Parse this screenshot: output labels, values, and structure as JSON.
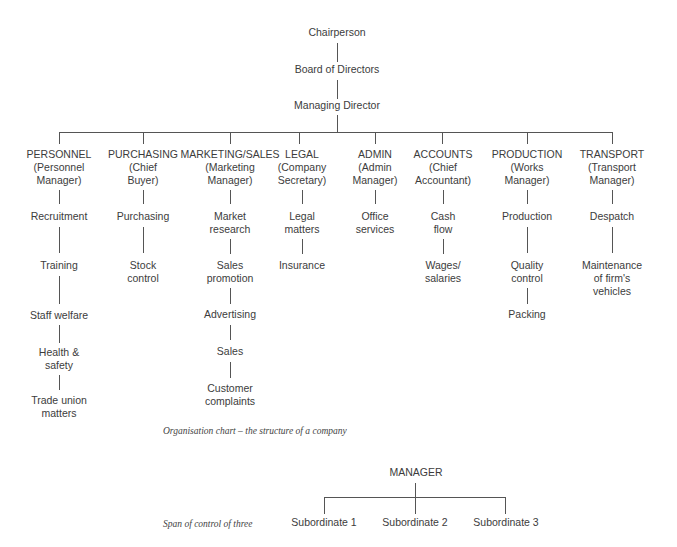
{
  "org_chart": {
    "top": [
      {
        "label": "Chairperson"
      },
      {
        "label": "Board of Directors"
      },
      {
        "label": "Managing Director"
      }
    ],
    "departments": [
      {
        "title": [
          "PERSONNEL",
          "(Personnel",
          "Manager)"
        ],
        "functions": [
          [
            "Recruitment"
          ],
          [
            "Training"
          ],
          [
            "Staff welfare"
          ],
          [
            "Health &",
            "safety"
          ],
          [
            "Trade union",
            "matters"
          ]
        ]
      },
      {
        "title": [
          "PURCHASING",
          "(Chief",
          "Buyer)"
        ],
        "functions": [
          [
            "Purchasing"
          ],
          [
            "Stock",
            "control"
          ]
        ]
      },
      {
        "title": [
          "MARKETING/SALES",
          "(Marketing",
          "Manager)"
        ],
        "functions": [
          [
            "Market",
            "research"
          ],
          [
            "Sales",
            "promotion"
          ],
          [
            "Advertising"
          ],
          [
            "Sales"
          ],
          [
            "Customer",
            "complaints"
          ]
        ]
      },
      {
        "title": [
          "LEGAL",
          "(Company",
          "Secretary)"
        ],
        "functions": [
          [
            "Legal",
            "matters"
          ],
          [
            "Insurance"
          ]
        ]
      },
      {
        "title": [
          "ADMIN",
          "(Admin",
          "Manager)"
        ],
        "functions": [
          [
            "Office",
            "services"
          ]
        ]
      },
      {
        "title": [
          "ACCOUNTS",
          "(Chief",
          "Accountant)"
        ],
        "functions": [
          [
            "Cash",
            "flow"
          ],
          [
            "Wages/",
            "salaries"
          ]
        ]
      },
      {
        "title": [
          "PRODUCTION",
          "(Works",
          "Manager)"
        ],
        "functions": [
          [
            "Production"
          ],
          [
            "Quality",
            "control"
          ],
          [
            "Packing"
          ]
        ]
      },
      {
        "title": [
          "TRANSPORT",
          "(Transport",
          "Manager)"
        ],
        "functions": [
          [
            "Despatch"
          ],
          [
            "Maintenance",
            "of firm's",
            "vehicles"
          ]
        ]
      }
    ],
    "caption": "Organisation chart – the structure of a company"
  },
  "span_chart": {
    "manager": "MANAGER",
    "subordinates": [
      "Subordinate 1",
      "Subordinate 2",
      "Subordinate 3"
    ],
    "caption": "Span of control of three"
  }
}
